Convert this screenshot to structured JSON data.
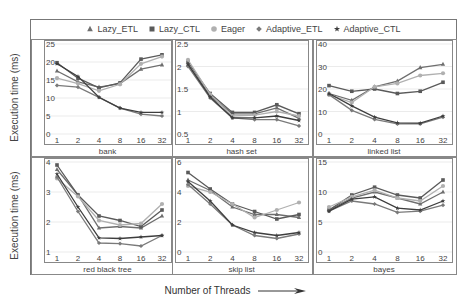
{
  "legend": [
    {
      "name": "Lazy_ETL",
      "marker": "triangle"
    },
    {
      "name": "Lazy_CTL",
      "marker": "square"
    },
    {
      "name": "Eager",
      "marker": "circle"
    },
    {
      "name": "Adaptive_ETL",
      "marker": "diamond"
    },
    {
      "name": "Adaptive_CTL",
      "marker": "star"
    }
  ],
  "y_axis_label": "Execution time (ms)",
  "x_axis_label": "Number of Threads",
  "chart_data": [
    {
      "type": "line",
      "title": "bank",
      "xlabel": "bank",
      "ylabel": "Execution time (ms)",
      "categories": [
        "1",
        "2",
        "4",
        "8",
        "16",
        "32"
      ],
      "ylim": [
        0,
        25
      ],
      "yticks": [
        0,
        5,
        10,
        15,
        20,
        25
      ],
      "series": [
        {
          "name": "Lazy_ETL",
          "values": [
            17.5,
            14.5,
            13.0,
            14.0,
            18.0,
            19.2
          ]
        },
        {
          "name": "Lazy_CTL",
          "values": [
            19.8,
            15.5,
            12.8,
            14.2,
            20.8,
            22.0
          ]
        },
        {
          "name": "Eager",
          "values": [
            15.5,
            14.0,
            12.0,
            13.8,
            19.5,
            21.5
          ]
        },
        {
          "name": "Adaptive_ETL",
          "values": [
            13.5,
            13.0,
            10.2,
            7.2,
            5.5,
            5.0
          ]
        },
        {
          "name": "Adaptive_CTL",
          "values": [
            19.5,
            16.0,
            10.2,
            7.2,
            6.0,
            6.0
          ]
        }
      ]
    },
    {
      "type": "line",
      "title": "hash set",
      "xlabel": "hash set",
      "ylabel": "",
      "categories": [
        "1",
        "2",
        "4",
        "8",
        "16",
        "32"
      ],
      "ylim": [
        0.5,
        2.5
      ],
      "yticks": [
        0.5,
        1,
        1.5,
        2,
        2.5
      ],
      "series": [
        {
          "name": "Lazy_ETL",
          "values": [
            2.05,
            1.35,
            0.95,
            0.95,
            1.08,
            0.85
          ]
        },
        {
          "name": "Lazy_CTL",
          "values": [
            2.1,
            1.4,
            0.98,
            0.98,
            1.15,
            0.95
          ]
        },
        {
          "name": "Eager",
          "values": [
            2.15,
            1.38,
            0.9,
            0.92,
            1.0,
            0.9
          ]
        },
        {
          "name": "Adaptive_ETL",
          "values": [
            2.0,
            1.3,
            0.86,
            0.82,
            0.82,
            0.68
          ]
        },
        {
          "name": "Adaptive_CTL",
          "values": [
            2.05,
            1.32,
            0.86,
            0.86,
            0.9,
            0.8
          ]
        }
      ]
    },
    {
      "type": "line",
      "title": "linked list",
      "xlabel": "linked list",
      "ylabel": "",
      "categories": [
        "1",
        "2",
        "4",
        "8",
        "16",
        "32"
      ],
      "ylim": [
        0,
        40
      ],
      "yticks": [
        0,
        10,
        20,
        30,
        40
      ],
      "series": [
        {
          "name": "Lazy_ETL",
          "values": [
            18.0,
            15.0,
            21.0,
            23.5,
            29.5,
            31.0
          ]
        },
        {
          "name": "Lazy_CTL",
          "values": [
            21.5,
            19.0,
            20.0,
            18.0,
            19.0,
            23.0
          ]
        },
        {
          "name": "Eager",
          "values": [
            17.5,
            14.0,
            21.0,
            22.5,
            26.0,
            27.0
          ]
        },
        {
          "name": "Adaptive_ETL",
          "values": [
            17.5,
            10.5,
            6.5,
            4.5,
            4.5,
            7.5
          ]
        },
        {
          "name": "Adaptive_CTL",
          "values": [
            18.0,
            12.5,
            7.5,
            5.0,
            4.8,
            8.0
          ]
        }
      ]
    },
    {
      "type": "line",
      "title": "red black tree",
      "xlabel": "red black tree",
      "ylabel": "Execution time (ms)",
      "categories": [
        "1",
        "2",
        "4",
        "8",
        "16",
        "32"
      ],
      "ylim": [
        1,
        4
      ],
      "yticks": [
        1,
        2,
        3,
        4
      ],
      "series": [
        {
          "name": "Lazy_ETL",
          "values": [
            3.75,
            2.9,
            1.8,
            1.85,
            1.8,
            2.2
          ]
        },
        {
          "name": "Lazy_CTL",
          "values": [
            3.9,
            2.9,
            2.2,
            2.05,
            1.85,
            2.4
          ]
        },
        {
          "name": "Eager",
          "values": [
            3.45,
            2.85,
            2.05,
            1.9,
            1.95,
            2.6
          ]
        },
        {
          "name": "Adaptive_ETL",
          "values": [
            3.5,
            2.35,
            1.3,
            1.28,
            1.2,
            1.55
          ]
        },
        {
          "name": "Adaptive_CTL",
          "values": [
            3.6,
            2.5,
            1.47,
            1.45,
            1.5,
            1.55
          ]
        }
      ]
    },
    {
      "type": "line",
      "title": "skip list",
      "xlabel": "skip list",
      "ylabel": "",
      "categories": [
        "1",
        "2",
        "4",
        "8",
        "16",
        "32"
      ],
      "ylim": [
        0,
        6
      ],
      "yticks": [
        0,
        2,
        4,
        6
      ],
      "series": [
        {
          "name": "Lazy_ETL",
          "values": [
            4.8,
            4.1,
            3.0,
            2.5,
            2.5,
            2.3
          ]
        },
        {
          "name": "Lazy_CTL",
          "values": [
            5.3,
            4.2,
            3.2,
            2.7,
            2.2,
            2.5
          ]
        },
        {
          "name": "Eager",
          "values": [
            4.4,
            4.0,
            3.2,
            2.3,
            2.8,
            3.3
          ]
        },
        {
          "name": "Adaptive_ETL",
          "values": [
            4.5,
            3.2,
            1.8,
            1.1,
            0.9,
            1.2
          ]
        },
        {
          "name": "Adaptive_CTL",
          "values": [
            4.7,
            3.4,
            1.8,
            1.3,
            1.1,
            1.3
          ]
        }
      ]
    },
    {
      "type": "line",
      "title": "bayes",
      "xlabel": "bayes",
      "ylabel": "",
      "categories": [
        "1",
        "2",
        "4",
        "8",
        "16",
        "32"
      ],
      "ylim": [
        0,
        15
      ],
      "yticks": [
        0,
        5,
        10,
        15
      ],
      "series": [
        {
          "name": "Lazy_ETL",
          "values": [
            7.0,
            9.0,
            10.0,
            9.0,
            8.0,
            10.0
          ]
        },
        {
          "name": "Lazy_CTL",
          "values": [
            7.0,
            9.5,
            10.8,
            9.5,
            9.0,
            12.0
          ]
        },
        {
          "name": "Eager",
          "values": [
            7.5,
            9.2,
            10.3,
            9.0,
            8.5,
            11.0
          ]
        },
        {
          "name": "Adaptive_ETL",
          "values": [
            6.8,
            8.5,
            8.0,
            6.6,
            6.8,
            7.8
          ]
        },
        {
          "name": "Adaptive_CTL",
          "values": [
            6.8,
            8.8,
            9.2,
            7.3,
            7.0,
            8.5
          ]
        }
      ]
    }
  ],
  "colors": {
    "Lazy_ETL": "#6e6e6e",
    "Lazy_CTL": "#5a5a5a",
    "Eager": "#b0b0b0",
    "Adaptive_ETL": "#7a7a7a",
    "Adaptive_CTL": "#3e3e3e",
    "grid": "#e6e6e6",
    "frame": "#777777"
  }
}
